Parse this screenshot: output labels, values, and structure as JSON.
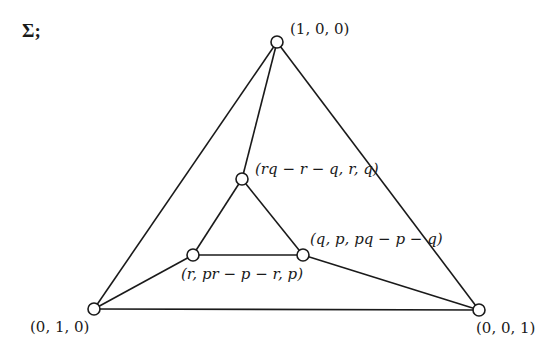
{
  "title": "Σ;",
  "nodes": [
    {
      "id": "top",
      "label": "(1, 0, 0)",
      "x": 277,
      "y": 42
    },
    {
      "id": "inner-top",
      "label": "(rq − r − q, r, q)",
      "x": 242,
      "y": 179
    },
    {
      "id": "inner-left",
      "label": "(r, pr − p − r, p)",
      "x": 193,
      "y": 255
    },
    {
      "id": "inner-right",
      "label": "(q, p, pq − p − q)",
      "x": 303,
      "y": 255
    },
    {
      "id": "bottom-left",
      "label": "(0, 1, 0)",
      "x": 94,
      "y": 309
    },
    {
      "id": "bottom-right",
      "label": "(0, 0, 1)",
      "x": 479,
      "y": 310
    }
  ],
  "edges": [
    [
      "top",
      "bottom-left"
    ],
    [
      "top",
      "bottom-right"
    ],
    [
      "bottom-left",
      "bottom-right"
    ],
    [
      "top",
      "inner-top"
    ],
    [
      "inner-top",
      "inner-left"
    ],
    [
      "inner-top",
      "inner-right"
    ],
    [
      "inner-left",
      "inner-right"
    ],
    [
      "inner-left",
      "bottom-left"
    ],
    [
      "inner-right",
      "bottom-right"
    ]
  ],
  "labels": {
    "top": "(1, 0, 0)",
    "inner_top": "(rq − r − q, r, q)",
    "inner_left": "(r, pr − p − r, p)",
    "inner_right": "(q, p, pq − p − q)",
    "bottom_left": "(0, 1, 0)",
    "bottom_right": "(0, 0, 1)"
  },
  "colors": {
    "stroke": "#1a1a1a",
    "node_fill": "#ffffff",
    "background": "#ffffff"
  }
}
